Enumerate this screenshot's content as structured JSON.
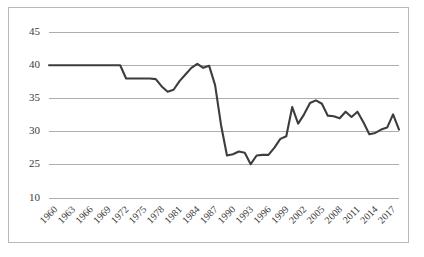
{
  "chart_data": {
    "type": "line",
    "title": "",
    "subtitle": "",
    "xlabel": "",
    "ylabel": "",
    "grid": true,
    "grid_axis": "y",
    "legend": false,
    "legend_position": "none",
    "line_color": "#3d3d3d",
    "grid_color": "#adadad",
    "border_color": "#b9b9b9",
    "background_color": "#ffffff",
    "ylim": [
      10,
      45
    ],
    "yticks": [
      10,
      25,
      30,
      35,
      40,
      45
    ],
    "ytick_labels": [
      "10",
      "25",
      "30",
      "35",
      "40",
      "45"
    ],
    "ytick_note": "Axis labels as printed: bottom tick reads 10 although gridlines are evenly spaced at 5-unit steps.",
    "xlim": [
      1960,
      2019
    ],
    "xticks": [
      1960,
      1963,
      1966,
      1969,
      1972,
      1975,
      1978,
      1981,
      1984,
      1987,
      1990,
      1993,
      1996,
      1999,
      2002,
      2005,
      2008,
      2011,
      2014,
      2017
    ],
    "xtick_labels": [
      "1960",
      "1963",
      "1966",
      "1969",
      "1972",
      "1975",
      "1978",
      "1981",
      "1984",
      "1987",
      "1990",
      "1993",
      "1996",
      "1999",
      "2002",
      "2005",
      "2008",
      "2011",
      "2014",
      "2017"
    ],
    "xtick_rotation": -45,
    "x": [
      1960,
      1961,
      1962,
      1963,
      1964,
      1965,
      1966,
      1967,
      1968,
      1969,
      1970,
      1971,
      1972,
      1973,
      1974,
      1975,
      1976,
      1977,
      1978,
      1979,
      1980,
      1981,
      1982,
      1983,
      1984,
      1985,
      1986,
      1987,
      1988,
      1989,
      1990,
      1991,
      1992,
      1993,
      1994,
      1995,
      1996,
      1997,
      1998,
      1999,
      2000,
      2001,
      2002,
      2003,
      2004,
      2005,
      2006,
      2007,
      2008,
      2009,
      2010,
      2011,
      2012,
      2013,
      2014,
      2015,
      2016,
      2017,
      2018,
      2019
    ],
    "values": [
      40.0,
      40.0,
      40.0,
      40.0,
      40.0,
      40.0,
      40.0,
      40.0,
      40.0,
      40.0,
      40.0,
      40.0,
      40.0,
      38.0,
      38.0,
      38.0,
      38.0,
      38.0,
      37.9,
      36.8,
      36.0,
      36.3,
      37.6,
      38.6,
      39.6,
      40.2,
      39.6,
      39.9,
      37.0,
      31.0,
      26.4,
      26.6,
      27.0,
      26.8,
      25.1,
      26.4,
      26.5,
      26.5,
      27.6,
      28.9,
      29.3,
      33.7,
      31.2,
      32.6,
      34.3,
      34.7,
      34.2,
      32.4,
      32.3,
      32.0,
      33.0,
      32.2,
      33.0,
      31.4,
      29.6,
      29.8,
      30.3,
      30.6,
      32.6,
      30.3
    ],
    "series": [
      {
        "name": "",
        "values": [
          40.0,
          40.0,
          40.0,
          40.0,
          40.0,
          40.0,
          40.0,
          40.0,
          40.0,
          40.0,
          40.0,
          40.0,
          40.0,
          38.0,
          38.0,
          38.0,
          38.0,
          38.0,
          37.9,
          36.8,
          36.0,
          36.3,
          37.6,
          38.6,
          39.6,
          40.2,
          39.6,
          39.9,
          37.0,
          31.0,
          26.4,
          26.6,
          27.0,
          26.8,
          25.1,
          26.4,
          26.5,
          26.5,
          27.6,
          28.9,
          29.3,
          33.7,
          31.2,
          32.6,
          34.3,
          34.7,
          34.2,
          32.4,
          32.3,
          32.0,
          33.0,
          32.2,
          33.0,
          31.4,
          29.6,
          29.8,
          30.3,
          30.6,
          32.6,
          30.3
        ]
      }
    ],
    "annotations": []
  }
}
